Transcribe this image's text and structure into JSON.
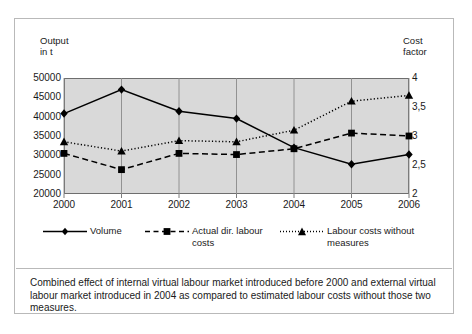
{
  "figure": {
    "caption": "Combined effect of internal virtual labour market introduced before 2000 and external virtual labour market  introduced in 2004 as compared to estimated labour costs without those two measures."
  },
  "chart_data": {
    "type": "line",
    "title": "",
    "xlabel": "",
    "ylabel": "Output\nin t",
    "y2label": "Cost\nfactor",
    "categories": [
      "2000",
      "2001",
      "2002",
      "2003",
      "2004",
      "2005",
      "2006"
    ],
    "ylim": [
      20000,
      50000
    ],
    "yticks": [
      "20000",
      "25000",
      "30000",
      "35000",
      "40000",
      "45000",
      "50000"
    ],
    "ytick_values": [
      20000,
      25000,
      30000,
      35000,
      40000,
      45000,
      50000
    ],
    "y2lim": [
      2,
      4
    ],
    "y2ticks": [
      "2",
      "2,5",
      "3",
      "3,5",
      "4"
    ],
    "y2tick_values": [
      2,
      2.5,
      3,
      3.5,
      4
    ],
    "grid": "vertical",
    "plot_background": "#d9d9d9",
    "legend_position": "below",
    "series": [
      {
        "name": "Volume",
        "axis": "left",
        "marker": "diamond",
        "line_style": "solid",
        "color": "#000000",
        "values": [
          40800,
          47000,
          41400,
          39500,
          32000,
          27700,
          30200
        ]
      },
      {
        "name": "Actual dir. labour\ncosts",
        "axis": "right",
        "marker": "square",
        "line_style": "dashed",
        "color": "#000000",
        "values": [
          2.7,
          2.42,
          2.7,
          2.68,
          2.78,
          3.05,
          3.0
        ]
      },
      {
        "name": "Labour costs without measures",
        "axis": "right",
        "marker": "triangle",
        "line_style": "dotted",
        "color": "#000000",
        "values": [
          2.9,
          2.74,
          2.92,
          2.9,
          3.1,
          3.6,
          3.7
        ]
      }
    ]
  }
}
